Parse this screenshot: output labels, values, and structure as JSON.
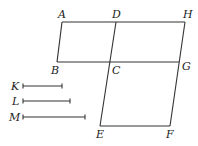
{
  "figure": {
    "points": {
      "A": {
        "label": "A",
        "x": 62,
        "y": 22
      },
      "D": {
        "label": "D",
        "x": 116,
        "y": 22
      },
      "H": {
        "label": "H",
        "x": 185,
        "y": 22
      },
      "B": {
        "label": "B",
        "x": 57,
        "y": 62
      },
      "C": {
        "label": "C",
        "x": 110,
        "y": 62
      },
      "G": {
        "label": "G",
        "x": 179,
        "y": 62
      },
      "E": {
        "label": "E",
        "x": 100,
        "y": 126
      },
      "F": {
        "label": "F",
        "x": 170,
        "y": 126
      }
    },
    "segments": [
      {
        "label": "K",
        "length": 39
      },
      {
        "label": "L",
        "length": 47
      },
      {
        "label": "M",
        "length": 62
      }
    ]
  }
}
